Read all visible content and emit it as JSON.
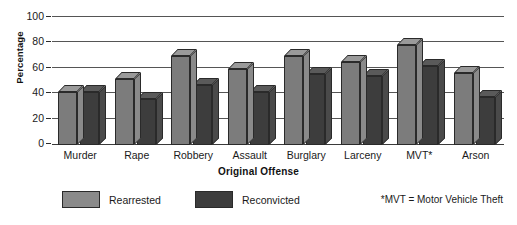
{
  "chart_data": {
    "type": "bar",
    "title": "",
    "xlabel": "Original Offense",
    "ylabel": "Percentage",
    "ylim": [
      0,
      100
    ],
    "yticks": [
      0,
      20,
      40,
      60,
      80,
      100
    ],
    "grid": true,
    "legend_position": "bottom-left",
    "style": "3d-grouped-bars",
    "categories": [
      "Murder",
      "Rape",
      "Robbery",
      "Assault",
      "Burglary",
      "Larceny",
      "MVT*",
      "Arson"
    ],
    "series": [
      {
        "name": "Rearrested",
        "color": "#8a8a8a",
        "values": [
          42,
          52,
          70,
          60,
          70,
          65,
          79,
          57
        ]
      },
      {
        "name": "Reconvicted",
        "color": "#3d3d3d",
        "values": [
          42,
          36,
          47,
          42,
          56,
          54,
          62,
          38
        ]
      }
    ],
    "annotations": [
      "*MVT = Motor Vehicle Theft"
    ]
  },
  "axes": {
    "y_title": "Percentage",
    "x_title": "Original Offense",
    "y_tick_labels": [
      "100",
      "80",
      "60",
      "40",
      "20",
      "0"
    ]
  },
  "legend": {
    "items": [
      {
        "label": "Rearrested"
      },
      {
        "label": "Reconvicted"
      }
    ]
  },
  "footnote": {
    "text": "*MVT = Motor Vehicle Theft"
  }
}
